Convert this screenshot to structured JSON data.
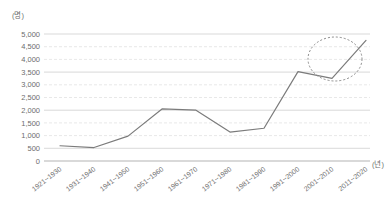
{
  "chart_data": {
    "type": "line",
    "title": "",
    "subtitle": "",
    "xlabel": "(년)",
    "ylabel": "(명)",
    "categories": [
      "1921~1930",
      "1931~1940",
      "1941~1950",
      "1951~1960",
      "1961~1970",
      "1971~1980",
      "1981~1990",
      "1991~2000",
      "2001~2010",
      "2011~2020"
    ],
    "values": [
      600,
      530,
      980,
      2050,
      2000,
      1140,
      1290,
      3520,
      3250,
      4750
    ],
    "series": [
      {
        "name": "",
        "values": [
          600,
          530,
          980,
          2050,
          2000,
          1140,
          1290,
          3520,
          3250,
          4750
        ]
      }
    ],
    "ylim": [
      0,
      5000
    ],
    "ytick_step": 500,
    "ytick_labels": [
      "0",
      "500",
      "1,000",
      "1,500",
      "2,000",
      "2,500",
      "3,000",
      "3,500",
      "4,000",
      "4,500",
      "5,000"
    ],
    "grid": true,
    "grid_axis": "y",
    "legend": false,
    "legend_position": "none",
    "line_color": "#7b7b7b",
    "grid_color": "#d9d9d9",
    "axis_color": "#b3b3b3",
    "text_color": "#6d6d6d",
    "annotations": [
      {
        "type": "ellipse",
        "style": "dashed",
        "label": "",
        "covers": [
          "2001~2010",
          "2011~2020"
        ]
      }
    ]
  }
}
